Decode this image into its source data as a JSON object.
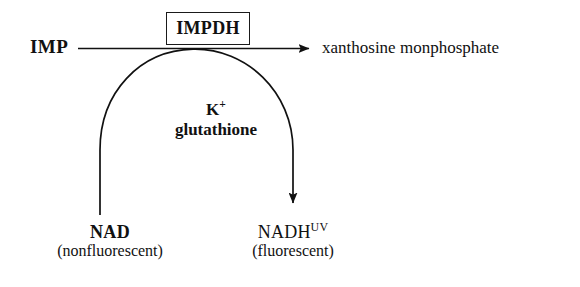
{
  "diagram": {
    "stroke_color": "#111111",
    "background_color": "#ffffff",
    "reactant": {
      "label": "IMP"
    },
    "enzyme": {
      "label": "IMPDH"
    },
    "product": {
      "label": "xanthosine monphosphate"
    },
    "cofactors": {
      "ion": "K",
      "ion_charge": "+",
      "secondary": "glutathione"
    },
    "cosubstrate": {
      "label": "NAD",
      "state": "(nonfluorescent)"
    },
    "coproduct": {
      "label": "NADH",
      "superscript": "UV",
      "state": "(fluorescent)"
    }
  }
}
